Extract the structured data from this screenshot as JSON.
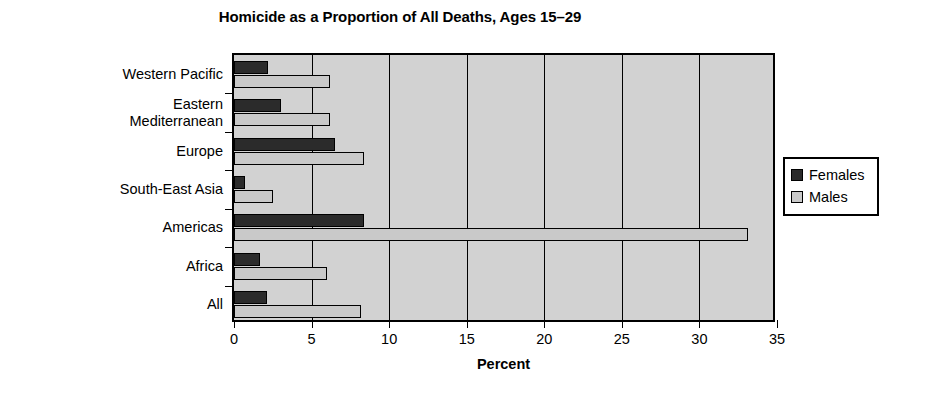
{
  "chart_data": {
    "type": "bar",
    "orientation": "horizontal",
    "title": "Homicide as a Proportion of All Deaths, Ages 15–29",
    "xlabel": "Percent",
    "ylabel": "WHO Region",
    "xlim": [
      0,
      35
    ],
    "xticks": [
      0,
      5,
      10,
      15,
      20,
      25,
      30,
      35
    ],
    "xtick_labels": [
      "0",
      "5",
      "10",
      "15",
      "20",
      "25",
      "30",
      "35"
    ],
    "grid": "vertical",
    "legend_position": "right-outside",
    "categories": [
      "Western Pacific",
      "Eastern Mediterranean",
      "Europe",
      "South-East Asia",
      "Americas",
      "Africa",
      "All"
    ],
    "category_lines": [
      [
        "Western Pacific"
      ],
      [
        "Eastern",
        "Mediterranean"
      ],
      [
        "Europe"
      ],
      [
        "South-East Asia"
      ],
      [
        "Americas"
      ],
      [
        "Africa"
      ],
      [
        "All"
      ]
    ],
    "series": [
      {
        "name": "Females",
        "color": "#2b2b2b",
        "values": [
          2.2,
          3.0,
          6.5,
          0.7,
          8.4,
          1.7,
          2.1
        ]
      },
      {
        "name": "Males",
        "color": "#c9c9c9",
        "values": [
          6.2,
          6.2,
          8.4,
          2.5,
          33.1,
          6.0,
          8.2
        ]
      }
    ]
  },
  "legend": {
    "entries": [
      {
        "label": "Females",
        "swatch": "female"
      },
      {
        "label": "Males",
        "swatch": "male"
      }
    ]
  },
  "colors": {
    "plot_background": "#d2d2d2",
    "page_background": "#ffffff",
    "axis": "#000000",
    "females": "#2b2b2b",
    "males": "#c9c9c9"
  }
}
